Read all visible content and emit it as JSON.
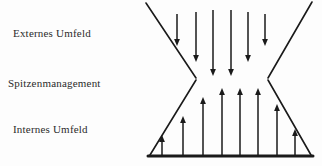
{
  "canvas": {
    "width": 322,
    "height": 166,
    "background": "#fdfdfd"
  },
  "labels": {
    "external": "Externes Umfeld",
    "top_management": "Spitzenmanagement",
    "internal": "Internes Umfeld"
  },
  "colors": {
    "stroke": "#1a1a1a",
    "text": "#2b2b2b",
    "background": "#fdfdfd"
  },
  "diagram": {
    "type": "hourglass-funnel",
    "outline_stroke_width": 1.6,
    "baseline_stroke_width": 3,
    "upper_funnel": {
      "left_top": [
        146,
        3
      ],
      "left_waist": [
        196,
        78
      ],
      "right_top": [
        312,
        2
      ],
      "right_waist": [
        268,
        78
      ]
    },
    "lower_funnel": {
      "left_waist": [
        196,
        80
      ],
      "left_bottom": [
        150,
        155
      ],
      "right_waist": [
        268,
        80
      ],
      "right_bottom": [
        311,
        155
      ],
      "baseline_y": 156,
      "baseline_x0": 148,
      "baseline_x1": 313
    },
    "down_arrows": [
      {
        "x": 177,
        "y0": 14,
        "y1": 46
      },
      {
        "x": 196,
        "y0": 12,
        "y1": 62
      },
      {
        "x": 213,
        "y0": 10,
        "y1": 76
      },
      {
        "x": 231,
        "y0": 10,
        "y1": 76
      },
      {
        "x": 248,
        "y0": 12,
        "y1": 62
      },
      {
        "x": 265,
        "y0": 14,
        "y1": 46
      }
    ],
    "up_arrows": [
      {
        "x": 162,
        "y0": 156,
        "y1": 135
      },
      {
        "x": 183,
        "y0": 156,
        "y1": 116
      },
      {
        "x": 203,
        "y0": 156,
        "y1": 97
      },
      {
        "x": 222,
        "y0": 156,
        "y1": 88
      },
      {
        "x": 240,
        "y0": 156,
        "y1": 88
      },
      {
        "x": 258,
        "y0": 156,
        "y1": 88
      },
      {
        "x": 277,
        "y0": 156,
        "y1": 104
      },
      {
        "x": 295,
        "y0": 156,
        "y1": 129
      }
    ]
  }
}
